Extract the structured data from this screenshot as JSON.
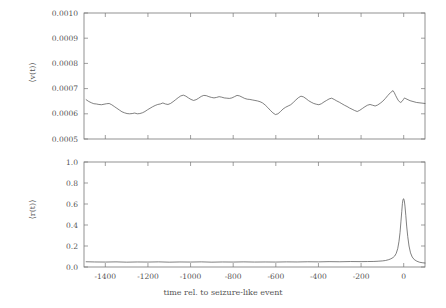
{
  "figure": {
    "background_color": "#ffffff",
    "line_color": "#4a4a4a",
    "frame_color": "#777777",
    "text_color": "#555555",
    "xlabel": "time rel. to seizure-like event"
  },
  "chart_data": [
    {
      "type": "line",
      "panel": "top",
      "title": "",
      "xlabel": "",
      "ylabel": "⟨v(t)⟩",
      "xlim": [
        -1500,
        100
      ],
      "ylim": [
        0.0005,
        0.001
      ],
      "xticks": [
        -1400,
        -1200,
        -1000,
        -800,
        -600,
        -400,
        -200,
        0
      ],
      "xticklabels": [
        "",
        "",
        "",
        "",
        "",
        "",
        "",
        ""
      ],
      "yticks": [
        0.0005,
        0.0006,
        0.0007,
        0.0008,
        0.0009,
        0.001
      ],
      "yticklabels": [
        "0.0005",
        "0.0006",
        "0.0007",
        "0.0008",
        "0.0009",
        "0.0010"
      ],
      "grid": false,
      "legend": null,
      "series": [
        {
          "name": "mean velocity",
          "x": [
            -1490,
            -1478,
            -1466,
            -1454,
            -1442,
            -1430,
            -1418,
            -1406,
            -1394,
            -1382,
            -1370,
            -1358,
            -1346,
            -1334,
            -1322,
            -1310,
            -1298,
            -1286,
            -1274,
            -1262,
            -1250,
            -1238,
            -1226,
            -1214,
            -1202,
            -1190,
            -1178,
            -1166,
            -1154,
            -1142,
            -1130,
            -1118,
            -1106,
            -1094,
            -1082,
            -1070,
            -1058,
            -1046,
            -1034,
            -1022,
            -1010,
            -998,
            -986,
            -974,
            -962,
            -950,
            -938,
            -926,
            -914,
            -902,
            -890,
            -878,
            -866,
            -854,
            -842,
            -830,
            -818,
            -806,
            -794,
            -782,
            -770,
            -758,
            -746,
            -734,
            -722,
            -710,
            -698,
            -686,
            -674,
            -662,
            -650,
            -638,
            -626,
            -614,
            -602,
            -590,
            -578,
            -566,
            -554,
            -542,
            -530,
            -518,
            -506,
            -494,
            -482,
            -470,
            -458,
            -446,
            -434,
            -422,
            -410,
            -398,
            -386,
            -374,
            -362,
            -350,
            -338,
            -326,
            -314,
            -302,
            -290,
            -278,
            -266,
            -254,
            -242,
            -230,
            -218,
            -206,
            -194,
            -182,
            -170,
            -158,
            -146,
            -134,
            -122,
            -110,
            -98,
            -86,
            -74,
            -62,
            -50,
            -44,
            -38,
            -32,
            -26,
            -20,
            -14,
            -8,
            -2,
            4,
            10,
            30,
            60,
            100
          ],
          "y": [
            0.000656,
            0.000649,
            0.000644,
            0.00064,
            0.000639,
            0.000637,
            0.000636,
            0.000638,
            0.00064,
            0.000641,
            0.000636,
            0.000629,
            0.000622,
            0.000615,
            0.000608,
            0.000604,
            0.000601,
            0.0006,
            0.000601,
            0.000603,
            0.0006,
            0.000601,
            0.000604,
            0.000609,
            0.000616,
            0.000622,
            0.000628,
            0.000633,
            0.000637,
            0.000639,
            0.000643,
            0.000639,
            0.000637,
            0.000641,
            0.000648,
            0.000656,
            0.000664,
            0.000671,
            0.000674,
            0.00067,
            0.000663,
            0.000657,
            0.000653,
            0.000656,
            0.000662,
            0.000669,
            0.000673,
            0.000672,
            0.000668,
            0.000665,
            0.000663,
            0.000665,
            0.000668,
            0.000666,
            0.000663,
            0.000662,
            0.000661,
            0.000663,
            0.000668,
            0.000673,
            0.000671,
            0.000666,
            0.000661,
            0.000658,
            0.000657,
            0.000655,
            0.000653,
            0.000651,
            0.000648,
            0.000643,
            0.000635,
            0.000625,
            0.000614,
            0.000604,
            0.000597,
            0.0006,
            0.000609,
            0.000619,
            0.000626,
            0.000631,
            0.000636,
            0.000645,
            0.000655,
            0.000664,
            0.00067,
            0.000667,
            0.00066,
            0.000652,
            0.000646,
            0.000641,
            0.000638,
            0.000636,
            0.00064,
            0.000647,
            0.000653,
            0.000659,
            0.000662,
            0.000657,
            0.000651,
            0.000646,
            0.00064,
            0.000634,
            0.000629,
            0.000623,
            0.000618,
            0.000613,
            0.000609,
            0.000614,
            0.000621,
            0.000628,
            0.000634,
            0.000637,
            0.000634,
            0.000631,
            0.000635,
            0.000642,
            0.00065,
            0.000661,
            0.000673,
            0.000684,
            0.000692,
            0.000684,
            0.000673,
            0.000663,
            0.000654,
            0.000648,
            0.000645,
            0.000649,
            0.000656,
            0.000663,
            0.00066,
            0.000652,
            0.000645,
            0.000641,
            0.000643,
            0.000646,
            0.000645
          ]
        }
      ]
    },
    {
      "type": "line",
      "panel": "bottom",
      "title": "",
      "xlabel": "time rel. to seizure-like event",
      "ylabel": "⟨r(t)⟩",
      "xlim": [
        -1500,
        100
      ],
      "ylim": [
        0.0,
        1.0
      ],
      "xticks": [
        -1400,
        -1200,
        -1000,
        -800,
        -600,
        -400,
        -200,
        0
      ],
      "xticklabels": [
        "-1400",
        "-1200",
        "-1000",
        "-800",
        "-600",
        "-400",
        "-200",
        "0"
      ],
      "yticks": [
        0.0,
        0.2,
        0.4,
        0.6,
        0.8,
        1.0
      ],
      "yticklabels": [
        "0.0",
        "0.2",
        "0.4",
        "0.6",
        "0.8",
        "1.0"
      ],
      "grid": false,
      "legend": null,
      "series": [
        {
          "name": "mean firing rate",
          "x": [
            -1490,
            -1450,
            -1400,
            -1350,
            -1300,
            -1250,
            -1200,
            -1150,
            -1100,
            -1050,
            -1000,
            -950,
            -900,
            -850,
            -800,
            -750,
            -700,
            -650,
            -600,
            -550,
            -500,
            -450,
            -400,
            -350,
            -300,
            -250,
            -200,
            -170,
            -140,
            -120,
            -100,
            -85,
            -70,
            -60,
            -50,
            -42,
            -35,
            -28,
            -22,
            -17,
            -13,
            -9,
            -6,
            -3,
            0,
            3,
            6,
            10,
            14,
            19,
            25,
            32,
            40,
            50,
            62,
            75,
            90,
            100
          ],
          "y": [
            0.05,
            0.048,
            0.047,
            0.049,
            0.046,
            0.048,
            0.047,
            0.049,
            0.046,
            0.048,
            0.047,
            0.049,
            0.046,
            0.048,
            0.047,
            0.049,
            0.047,
            0.048,
            0.047,
            0.049,
            0.048,
            0.05,
            0.049,
            0.051,
            0.05,
            0.052,
            0.051,
            0.052,
            0.053,
            0.055,
            0.058,
            0.062,
            0.07,
            0.078,
            0.09,
            0.105,
            0.13,
            0.175,
            0.245,
            0.33,
            0.43,
            0.53,
            0.605,
            0.645,
            0.65,
            0.63,
            0.58,
            0.49,
            0.39,
            0.29,
            0.2,
            0.135,
            0.095,
            0.07,
            0.055,
            0.045,
            0.04,
            0.038
          ]
        }
      ]
    }
  ]
}
